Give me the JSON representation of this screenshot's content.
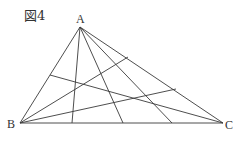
{
  "figure": {
    "caption": "図4",
    "stroke_color": "#3a3a3a",
    "background": "#ffffff"
  },
  "vertices": {
    "A": {
      "label": "A",
      "x": 80,
      "y": 27
    },
    "B": {
      "label": "B",
      "x": 20,
      "y": 123
    },
    "C": {
      "label": "C",
      "x": 223,
      "y": 123
    }
  },
  "triangle_sides": [
    {
      "name": "AB",
      "from": [
        80,
        27
      ],
      "to": [
        20,
        123
      ]
    },
    {
      "name": "BC",
      "from": [
        20,
        123
      ],
      "to": [
        223,
        123
      ]
    },
    {
      "name": "CA",
      "from": [
        223,
        123
      ],
      "to": [
        80,
        27
      ]
    }
  ],
  "cevians_from_A": [
    {
      "from": [
        80,
        27
      ],
      "to": [
        72,
        123
      ]
    },
    {
      "from": [
        80,
        27
      ],
      "to": [
        123,
        123
      ]
    },
    {
      "from": [
        80,
        27
      ],
      "to": [
        172,
        123
      ]
    }
  ],
  "cevians_from_B": [
    {
      "from": [
        20,
        123
      ],
      "to": [
        128,
        57
      ]
    },
    {
      "from": [
        20,
        123
      ],
      "to": [
        176,
        89
      ]
    }
  ],
  "cevians_from_C": [
    {
      "from": [
        223,
        123
      ],
      "to": [
        50,
        75
      ]
    }
  ]
}
